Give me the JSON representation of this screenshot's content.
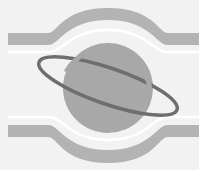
{
  "image": {
    "description": "Grayscale planet-with-ring logo over arched horizontal bands",
    "width": 199,
    "height": 170
  },
  "colors": {
    "background": "#f2f2f2",
    "band": "#b5b5b5",
    "band_light": "#d8d8d8",
    "highlight": "#ffffff",
    "planet": "#a9a9a9",
    "ring_dark": "#6a6a6a",
    "ring_light": "#9a9a9a"
  },
  "icons": {
    "logo": "planet-ring-icon"
  }
}
